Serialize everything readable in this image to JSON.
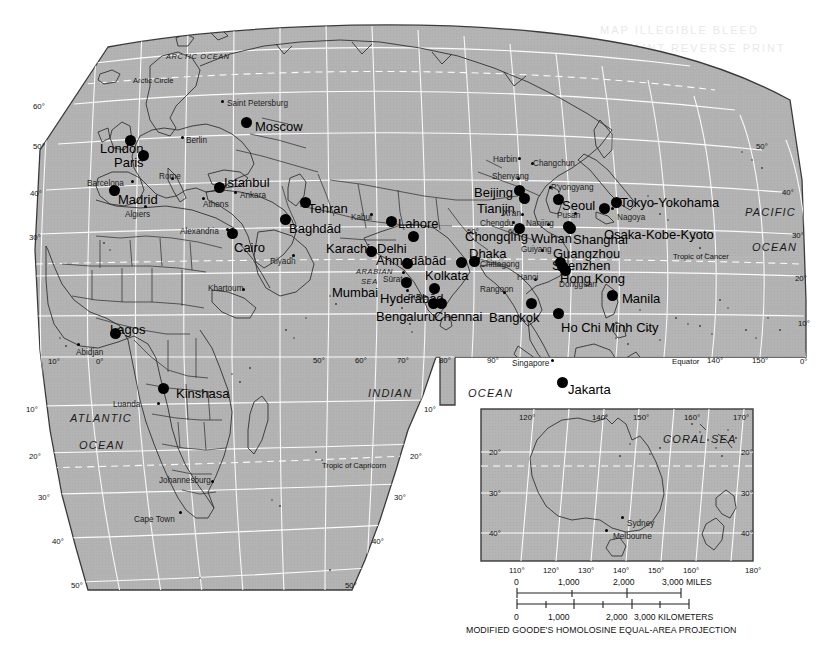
{
  "meta": {
    "projection_caption": "MODIFIED GOODE'S HOMOLOSINE EQUAL-AREA PROJECTION",
    "land_color": "#b5b5b5",
    "graticule_color": "#ffffff",
    "border_color": "#3c3c3c",
    "text_color": "#111111"
  },
  "ghost_text": {
    "line1": "MAP ILLEGIBLE BLEED",
    "line2": "FAINT REVERSE PRINT"
  },
  "oceans": [
    {
      "name": "ARCTIC  OCEAN",
      "x": 166,
      "y": 53,
      "cls": "ocean-small"
    },
    {
      "name": "PACIFIC",
      "x": 745,
      "y": 207,
      "cls": "ocean"
    },
    {
      "name": "OCEAN",
      "x": 752,
      "y": 242,
      "cls": "ocean"
    },
    {
      "name": "INDIAN",
      "x": 368,
      "y": 388,
      "cls": "ocean"
    },
    {
      "name": "OCEAN",
      "x": 468,
      "y": 388,
      "cls": "ocean"
    },
    {
      "name": "ATLANTIC",
      "x": 70,
      "y": 413,
      "cls": "ocean"
    },
    {
      "name": "OCEAN",
      "x": 79,
      "y": 440,
      "cls": "ocean"
    },
    {
      "name": "ARABIAN",
      "x": 356,
      "y": 268,
      "cls": "ocean-small"
    },
    {
      "name": "SEA",
      "x": 361,
      "y": 278,
      "cls": "ocean-small"
    },
    {
      "name": "CORAL SEA",
      "x": 663,
      "y": 434,
      "cls": "ocean"
    }
  ],
  "reference_lines": [
    {
      "label": "Arctic Circle",
      "x": 133,
      "y": 77,
      "cls": "tropic-lbl"
    },
    {
      "label": "Tropic of Cancer",
      "x": 673,
      "y": 253,
      "cls": "tropic-lbl"
    },
    {
      "label": "Tropic of Capricorn",
      "x": 322,
      "y": 462,
      "cls": "tropic-lbl"
    },
    {
      "label": "Equator",
      "x": 672,
      "y": 358,
      "cls": "graticule-lbl"
    }
  ],
  "graticule_labels": [
    {
      "t": "60°",
      "x": 33,
      "y": 103
    },
    {
      "t": "50°",
      "x": 33,
      "y": 143
    },
    {
      "t": "40°",
      "x": 30,
      "y": 190
    },
    {
      "t": "30°",
      "x": 29,
      "y": 234
    },
    {
      "t": "10°",
      "x": 48,
      "y": 358
    },
    {
      "t": "0°",
      "x": 96,
      "y": 358
    },
    {
      "t": "10°",
      "x": 26,
      "y": 406
    },
    {
      "t": "20°",
      "x": 29,
      "y": 453
    },
    {
      "t": "30°",
      "x": 38,
      "y": 494
    },
    {
      "t": "40°",
      "x": 52,
      "y": 538
    },
    {
      "t": "50°",
      "x": 71,
      "y": 582
    },
    {
      "t": "50°",
      "x": 345,
      "y": 582
    },
    {
      "t": "40°",
      "x": 372,
      "y": 538
    },
    {
      "t": "30°",
      "x": 394,
      "y": 494
    },
    {
      "t": "20°",
      "x": 410,
      "y": 453
    },
    {
      "t": "10°",
      "x": 424,
      "y": 406
    },
    {
      "t": "50°",
      "x": 313,
      "y": 357
    },
    {
      "t": "60°",
      "x": 355,
      "y": 357
    },
    {
      "t": "70°",
      "x": 397,
      "y": 357
    },
    {
      "t": "80°",
      "x": 439,
      "y": 357
    },
    {
      "t": "90°",
      "x": 487,
      "y": 357
    },
    {
      "t": "140°",
      "x": 707,
      "y": 357
    },
    {
      "t": "150°",
      "x": 752,
      "y": 357
    },
    {
      "t": "0°",
      "x": 800,
      "y": 358
    },
    {
      "t": "10°",
      "x": 798,
      "y": 320
    },
    {
      "t": "20°",
      "x": 795,
      "y": 275
    },
    {
      "t": "30°",
      "x": 792,
      "y": 232
    },
    {
      "t": "40°",
      "x": 782,
      "y": 189
    },
    {
      "t": "50°",
      "x": 756,
      "y": 143
    },
    {
      "t": "50°",
      "x": 467,
      "y": 228
    },
    {
      "t": "60°",
      "x": 508,
      "y": 228
    }
  ],
  "cities_major": [
    {
      "name": "Moscow",
      "lx": 255,
      "ly": 120,
      "dx": 246,
      "dy": 122,
      "anchor": "left"
    },
    {
      "name": "London",
      "lx": 100,
      "ly": 142,
      "dx": 130,
      "dy": 140,
      "anchor": "left"
    },
    {
      "name": "Paris",
      "lx": 114,
      "ly": 156,
      "dx": 143,
      "dy": 155,
      "anchor": "left"
    },
    {
      "name": "Madrid",
      "lx": 118,
      "ly": 193,
      "dx": 114,
      "dy": 190,
      "anchor": "left"
    },
    {
      "name": "Istanbul",
      "lx": 224,
      "ly": 176,
      "dx": 219,
      "dy": 187,
      "anchor": "left"
    },
    {
      "name": "Cairo",
      "lx": 234,
      "ly": 241,
      "dx": 232,
      "dy": 233,
      "anchor": "left"
    },
    {
      "name": "Baghdād",
      "lx": 289,
      "ly": 222,
      "dx": 285,
      "dy": 219,
      "anchor": "left"
    },
    {
      "name": "Tehran",
      "lx": 308,
      "ly": 202,
      "dx": 305,
      "dy": 202,
      "anchor": "left"
    },
    {
      "name": "Lahore",
      "lx": 398,
      "ly": 217,
      "dx": 391,
      "dy": 221,
      "anchor": "left"
    },
    {
      "name": "Delhi",
      "lx": 377,
      "ly": 242,
      "dx": 413,
      "dy": 236,
      "anchor": "left"
    },
    {
      "name": "Karachi",
      "lx": 326,
      "ly": 242,
      "dx": 371,
      "dy": 251,
      "anchor": "left"
    },
    {
      "name": "Mumbai",
      "lx": 332,
      "ly": 286,
      "dx": 406,
      "dy": 282,
      "anchor": "left"
    },
    {
      "name": "Kolkata",
      "lx": 425,
      "ly": 269,
      "dx": 461,
      "dy": 262,
      "anchor": "left"
    },
    {
      "name": "Dhaka",
      "lx": 469,
      "ly": 247,
      "dx": 474,
      "dy": 261,
      "anchor": "left"
    },
    {
      "name": "Chongqing",
      "lx": 465,
      "ly": 230,
      "dx": 519,
      "dy": 228,
      "anchor": "left"
    },
    {
      "name": "Beijing",
      "lx": 474,
      "ly": 186,
      "dx": 519,
      "dy": 190,
      "anchor": "left"
    },
    {
      "name": "Tianjin",
      "lx": 477,
      "ly": 202,
      "dx": 524,
      "dy": 198,
      "anchor": "left"
    },
    {
      "name": "Wuhan",
      "lx": 531,
      "ly": 232,
      "dx": 568,
      "dy": 226,
      "anchor": "left"
    },
    {
      "name": "Shanghai",
      "lx": 573,
      "ly": 233,
      "dx": 570,
      "dy": 228,
      "anchor": "left"
    },
    {
      "name": "Seoul",
      "lx": 562,
      "ly": 199,
      "dx": 558,
      "dy": 199,
      "anchor": "left"
    },
    {
      "name": "Tokyo-Yokohama",
      "lx": 620,
      "ly": 196,
      "dx": 616,
      "dy": 202,
      "anchor": "left"
    },
    {
      "name": "Osaka-Kobe-Kyoto",
      "lx": 604,
      "ly": 228,
      "dx": 604,
      "dy": 208,
      "anchor": "left"
    },
    {
      "name": "Guangzhou",
      "lx": 553,
      "ly": 247,
      "dx": 560,
      "dy": 262,
      "anchor": "left"
    },
    {
      "name": "Shenzhen",
      "lx": 552,
      "ly": 259,
      "dx": 562,
      "dy": 266,
      "anchor": "left"
    },
    {
      "name": "Hong Kong",
      "lx": 560,
      "ly": 272,
      "dx": 565,
      "dy": 270,
      "anchor": "left"
    },
    {
      "name": "Manila",
      "lx": 622,
      "ly": 292,
      "dx": 612,
      "dy": 295,
      "anchor": "left"
    },
    {
      "name": "Bangkok",
      "lx": 489,
      "ly": 311,
      "dx": 531,
      "dy": 303,
      "anchor": "left"
    },
    {
      "name": "Ho Chi Minh City",
      "lx": 561,
      "ly": 321,
      "dx": 558,
      "dy": 313,
      "anchor": "left"
    },
    {
      "name": "Hyderābād",
      "lx": 380,
      "ly": 292,
      "dx": 434,
      "dy": 288,
      "anchor": "left"
    },
    {
      "name": "Chennai",
      "lx": 434,
      "ly": 310,
      "dx": 441,
      "dy": 303,
      "anchor": "left"
    },
    {
      "name": "Bengaluru",
      "lx": 376,
      "ly": 310,
      "dx": 433,
      "dy": 303,
      "anchor": "left"
    },
    {
      "name": "Kinshasa",
      "lx": 176,
      "ly": 387,
      "dx": 163,
      "dy": 388,
      "anchor": "left"
    },
    {
      "name": "Lagos",
      "lx": 110,
      "ly": 323,
      "dx": 115,
      "dy": 333,
      "anchor": "left"
    },
    {
      "name": "Ahmadābād",
      "lx": 376,
      "ly": 254,
      "dx": 407,
      "dy": 263,
      "anchor": "left"
    },
    {
      "name": "Jakarta",
      "lx": 568,
      "ly": 383,
      "dx": 562,
      "dy": 382,
      "anchor": "left"
    }
  ],
  "cities_minor": [
    {
      "name": "Saint Petersburg",
      "lx": 227,
      "ly": 100,
      "dx": 222,
      "dy": 101
    },
    {
      "name": "Berlin",
      "lx": 186,
      "ly": 137,
      "dx": 182,
      "dy": 137
    },
    {
      "name": "Rome",
      "lx": 159,
      "ly": 173,
      "dx": 172,
      "dy": 178
    },
    {
      "name": "Barcelona",
      "lx": 87,
      "ly": 180,
      "dx": 132,
      "dy": 181
    },
    {
      "name": "Algiers",
      "lx": 125,
      "ly": 211,
      "dx": 145,
      "dy": 206
    },
    {
      "name": "Athens",
      "lx": 203,
      "ly": 201,
      "dx": 203,
      "dy": 198
    },
    {
      "name": "Ankara",
      "lx": 240,
      "ly": 192,
      "dx": 235,
      "dy": 192
    },
    {
      "name": "Alexandria",
      "lx": 180,
      "ly": 228,
      "dx": 227,
      "dy": 229
    },
    {
      "name": "Riyadh",
      "lx": 270,
      "ly": 258,
      "dx": 293,
      "dy": 255
    },
    {
      "name": "Khartoum",
      "lx": 208,
      "ly": 285,
      "dx": 243,
      "dy": 289
    },
    {
      "name": "Kabul",
      "lx": 351,
      "ly": 214,
      "dx": 371,
      "dy": 214
    },
    {
      "name": "Sūrat",
      "lx": 383,
      "ly": 276,
      "dx": 403,
      "dy": 272
    },
    {
      "name": "Pune",
      "lx": 408,
      "ly": 294,
      "dx": 407,
      "dy": 290
    },
    {
      "name": "Chittagong",
      "lx": 480,
      "ly": 261,
      "dx": 478,
      "dy": 258
    },
    {
      "name": "Rangoon",
      "lx": 480,
      "ly": 286,
      "dx": 504,
      "dy": 292
    },
    {
      "name": "Hanoi",
      "lx": 517,
      "ly": 274,
      "dx": 535,
      "dy": 279
    },
    {
      "name": "Dongguan",
      "lx": 559,
      "ly": 281,
      "dx": 563,
      "dy": 272
    },
    {
      "name": "Guiyang",
      "lx": 521,
      "ly": 246,
      "dx": 542,
      "dy": 250
    },
    {
      "name": "Chengdu",
      "lx": 480,
      "ly": 220,
      "dx": 513,
      "dy": 222
    },
    {
      "name": "Nanjing",
      "lx": 526,
      "ly": 220,
      "dx": 548,
      "dy": 224
    },
    {
      "name": "Xi'an",
      "lx": 503,
      "ly": 210,
      "dx": 522,
      "dy": 214
    },
    {
      "name": "Shenyang",
      "lx": 492,
      "ly": 173,
      "dx": 518,
      "dy": 178
    },
    {
      "name": "Harbin",
      "lx": 493,
      "ly": 156,
      "dx": 519,
      "dy": 158
    },
    {
      "name": "Changchun",
      "lx": 533,
      "ly": 160,
      "dx": 532,
      "dy": 163
    },
    {
      "name": "P'yongyang",
      "lx": 551,
      "ly": 184,
      "dx": 550,
      "dy": 187
    },
    {
      "name": "Pusan",
      "lx": 557,
      "ly": 212,
      "dx": 575,
      "dy": 213
    },
    {
      "name": "Nagoya",
      "lx": 617,
      "ly": 214,
      "dx": 612,
      "dy": 208
    },
    {
      "name": "Singapore",
      "lx": 512,
      "ly": 360,
      "dx": 552,
      "dy": 360
    },
    {
      "name": "Abidjan",
      "lx": 76,
      "ly": 349,
      "dx": 78,
      "dy": 344
    },
    {
      "name": "Luanda",
      "lx": 113,
      "ly": 401,
      "dx": 158,
      "dy": 403
    },
    {
      "name": "Johannesburg",
      "lx": 159,
      "ly": 477,
      "dx": 212,
      "dy": 481
    },
    {
      "name": "Cape Town",
      "lx": 134,
      "ly": 516,
      "dx": 180,
      "dy": 512
    }
  ],
  "inset": {
    "graticule_top": [
      {
        "t": "120°",
        "x": 519,
        "y": 414
      },
      {
        "t": "140°",
        "x": 592,
        "y": 414
      },
      {
        "t": "150°",
        "x": 633,
        "y": 414
      },
      {
        "t": "160°",
        "x": 684,
        "y": 414
      },
      {
        "t": "170°",
        "x": 733,
        "y": 414
      }
    ],
    "graticule_bottom": [
      {
        "t": "110°",
        "x": 509,
        "y": 567
      },
      {
        "t": "120°",
        "x": 543,
        "y": 567
      },
      {
        "t": "130°",
        "x": 578,
        "y": 567
      },
      {
        "t": "140°",
        "x": 613,
        "y": 567
      },
      {
        "t": "150°",
        "x": 648,
        "y": 567
      },
      {
        "t": "160°",
        "x": 683,
        "y": 567
      },
      {
        "t": "180°",
        "x": 745,
        "y": 567
      }
    ],
    "graticule_sides": [
      {
        "t": "20°",
        "x": 489,
        "y": 449
      },
      {
        "t": "30°",
        "x": 489,
        "y": 490
      },
      {
        "t": "40°",
        "x": 489,
        "y": 530
      },
      {
        "t": "20°",
        "x": 741,
        "y": 449
      },
      {
        "t": "30°",
        "x": 741,
        "y": 490
      },
      {
        "t": "40°",
        "x": 741,
        "y": 530
      }
    ],
    "cities": [
      {
        "name": "Sydney",
        "lx": 627,
        "ly": 520,
        "dx": 622,
        "dy": 517
      },
      {
        "name": "Melbourne",
        "lx": 613,
        "ly": 533,
        "dx": 606,
        "dy": 530
      }
    ]
  },
  "scale_bar": {
    "miles_unit": "3,000 MILES",
    "km_unit": "3,000 KILOMETERS",
    "miles_ticks": [
      "0",
      "1,000",
      "2,000"
    ],
    "km_ticks": [
      "0",
      "1,000",
      "2,000"
    ]
  }
}
